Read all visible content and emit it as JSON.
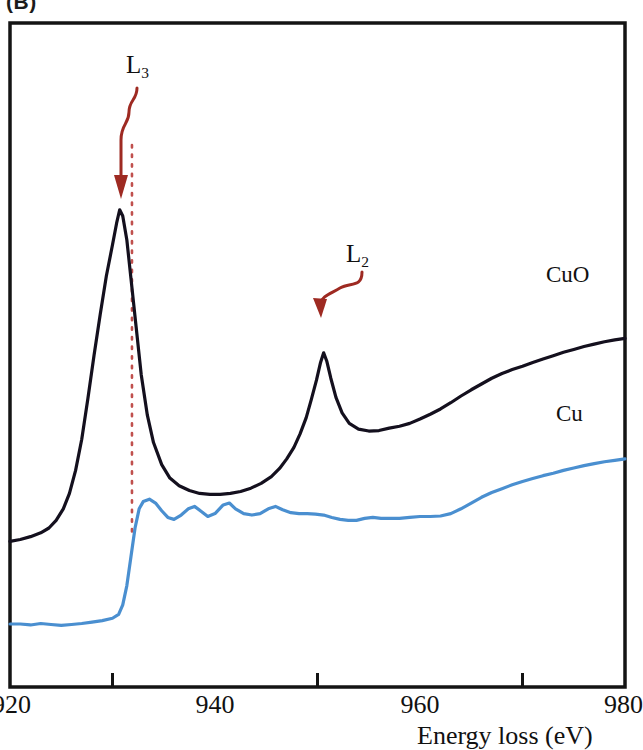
{
  "panel": {
    "letter": "(B)"
  },
  "axis": {
    "x_title": "Energy loss (eV)",
    "ticks": [
      {
        "value": 920,
        "label": "920",
        "major": true
      },
      {
        "value": 930,
        "label": "",
        "major": false
      },
      {
        "value": 940,
        "label": "940",
        "major": true
      },
      {
        "value": 950,
        "label": "",
        "major": false
      },
      {
        "value": 960,
        "label": "960",
        "major": true
      },
      {
        "value": 970,
        "label": "",
        "major": false
      },
      {
        "value": 980,
        "label": "980",
        "major": true
      }
    ]
  },
  "annotations": {
    "l3": {
      "label": "L",
      "sub": "3",
      "arrow_color": "#9e2a22"
    },
    "l2": {
      "label": "L",
      "sub": "2",
      "arrow_color": "#9e2a22"
    },
    "guide_line": {
      "energy": 931.9,
      "color": "#c0504d",
      "style": "dotted"
    }
  },
  "colors": {
    "cuo": "#14101e",
    "cu": "#4a8fd0",
    "frame": "#141414",
    "arrow": "#9e2a22",
    "guide": "#c0504d"
  },
  "chart_data": {
    "type": "line",
    "title": "",
    "xlabel": "Energy loss (eV)",
    "ylabel": "",
    "xlim": [
      920,
      980
    ],
    "ylim": [
      0,
      1
    ],
    "grid": false,
    "legend": "inline-curve-labels",
    "tick_labels_x": [
      "920",
      "940",
      "960",
      "980"
    ],
    "minor_ticks_x": [
      930,
      950,
      970
    ],
    "annotations": [
      {
        "text": "L3",
        "type": "peak-arrow",
        "x": 930.7,
        "note": "L3 white line of CuO"
      },
      {
        "text": "L2",
        "type": "peak-arrow",
        "x": 950.6,
        "note": "L2 white line of CuO"
      },
      {
        "text": "dotted vertical guide",
        "x": 931.9
      }
    ],
    "series": [
      {
        "name": "CuO",
        "color": "#14101e",
        "label_x": 972,
        "points": [
          [
            920.0,
            0.272
          ],
          [
            921.0,
            0.276
          ],
          [
            922.0,
            0.282
          ],
          [
            923.0,
            0.29
          ],
          [
            923.8,
            0.3
          ],
          [
            924.5,
            0.316
          ],
          [
            925.2,
            0.34
          ],
          [
            925.8,
            0.372
          ],
          [
            926.4,
            0.42
          ],
          [
            927.0,
            0.485
          ],
          [
            927.6,
            0.57
          ],
          [
            928.2,
            0.66
          ],
          [
            928.8,
            0.745
          ],
          [
            929.4,
            0.825
          ],
          [
            930.0,
            0.89
          ],
          [
            930.4,
            0.935
          ],
          [
            930.7,
            0.963
          ],
          [
            931.0,
            0.95
          ],
          [
            931.4,
            0.9
          ],
          [
            931.8,
            0.82
          ],
          [
            932.3,
            0.72
          ],
          [
            932.8,
            0.62
          ],
          [
            933.4,
            0.535
          ],
          [
            934.0,
            0.478
          ],
          [
            934.8,
            0.432
          ],
          [
            935.6,
            0.404
          ],
          [
            936.5,
            0.388
          ],
          [
            937.5,
            0.378
          ],
          [
            938.5,
            0.372
          ],
          [
            939.5,
            0.37
          ],
          [
            940.5,
            0.37
          ],
          [
            941.5,
            0.372
          ],
          [
            942.5,
            0.376
          ],
          [
            943.5,
            0.383
          ],
          [
            944.5,
            0.393
          ],
          [
            945.5,
            0.407
          ],
          [
            946.3,
            0.424
          ],
          [
            947.0,
            0.444
          ],
          [
            947.7,
            0.468
          ],
          [
            948.3,
            0.496
          ],
          [
            948.9,
            0.53
          ],
          [
            949.4,
            0.568
          ],
          [
            949.9,
            0.608
          ],
          [
            950.3,
            0.645
          ],
          [
            950.6,
            0.665
          ],
          [
            950.9,
            0.648
          ],
          [
            951.3,
            0.612
          ],
          [
            951.8,
            0.572
          ],
          [
            952.4,
            0.54
          ],
          [
            953.1,
            0.518
          ],
          [
            954.0,
            0.506
          ],
          [
            955.0,
            0.502
          ],
          [
            956.0,
            0.503
          ],
          [
            957.0,
            0.508
          ],
          [
            958.0,
            0.512
          ],
          [
            959.0,
            0.518
          ],
          [
            960.0,
            0.527
          ],
          [
            961.0,
            0.537
          ],
          [
            962.0,
            0.548
          ],
          [
            963.0,
            0.561
          ],
          [
            964.0,
            0.575
          ],
          [
            965.0,
            0.588
          ],
          [
            966.0,
            0.6
          ],
          [
            967.0,
            0.612
          ],
          [
            968.0,
            0.622
          ],
          [
            969.0,
            0.63
          ],
          [
            970.0,
            0.637
          ],
          [
            971.0,
            0.645
          ],
          [
            972.0,
            0.652
          ],
          [
            973.0,
            0.659
          ],
          [
            974.0,
            0.666
          ],
          [
            975.0,
            0.672
          ],
          [
            976.0,
            0.678
          ],
          [
            977.0,
            0.683
          ],
          [
            978.0,
            0.688
          ],
          [
            979.0,
            0.692
          ],
          [
            980.0,
            0.695
          ]
        ]
      },
      {
        "name": "Cu",
        "color": "#4a8fd0",
        "label_x": 973,
        "points": [
          [
            920.0,
            0.1
          ],
          [
            921.0,
            0.1
          ],
          [
            922.0,
            0.098
          ],
          [
            923.0,
            0.101
          ],
          [
            924.0,
            0.099
          ],
          [
            925.0,
            0.097
          ],
          [
            926.0,
            0.099
          ],
          [
            927.0,
            0.101
          ],
          [
            928.0,
            0.104
          ],
          [
            929.0,
            0.107
          ],
          [
            930.0,
            0.112
          ],
          [
            930.6,
            0.12
          ],
          [
            931.0,
            0.14
          ],
          [
            931.4,
            0.18
          ],
          [
            931.8,
            0.24
          ],
          [
            932.2,
            0.3
          ],
          [
            932.6,
            0.34
          ],
          [
            933.0,
            0.355
          ],
          [
            933.6,
            0.36
          ],
          [
            934.2,
            0.352
          ],
          [
            934.8,
            0.336
          ],
          [
            935.4,
            0.322
          ],
          [
            936.0,
            0.318
          ],
          [
            936.7,
            0.327
          ],
          [
            937.4,
            0.34
          ],
          [
            938.0,
            0.345
          ],
          [
            938.7,
            0.334
          ],
          [
            939.3,
            0.324
          ],
          [
            940.0,
            0.33
          ],
          [
            940.8,
            0.348
          ],
          [
            941.4,
            0.352
          ],
          [
            942.0,
            0.34
          ],
          [
            942.8,
            0.33
          ],
          [
            943.6,
            0.327
          ],
          [
            944.4,
            0.33
          ],
          [
            945.2,
            0.34
          ],
          [
            945.9,
            0.345
          ],
          [
            946.6,
            0.338
          ],
          [
            947.4,
            0.332
          ],
          [
            948.2,
            0.33
          ],
          [
            949.0,
            0.33
          ],
          [
            949.8,
            0.329
          ],
          [
            950.6,
            0.327
          ],
          [
            951.4,
            0.322
          ],
          [
            952.2,
            0.318
          ],
          [
            953.0,
            0.316
          ],
          [
            953.8,
            0.316
          ],
          [
            954.6,
            0.32
          ],
          [
            955.4,
            0.322
          ],
          [
            956.2,
            0.32
          ],
          [
            957.0,
            0.32
          ],
          [
            958.0,
            0.32
          ],
          [
            959.0,
            0.322
          ],
          [
            960.0,
            0.324
          ],
          [
            961.0,
            0.324
          ],
          [
            962.0,
            0.325
          ],
          [
            963.0,
            0.33
          ],
          [
            964.0,
            0.34
          ],
          [
            965.0,
            0.352
          ],
          [
            966.0,
            0.364
          ],
          [
            967.0,
            0.374
          ],
          [
            968.0,
            0.382
          ],
          [
            969.0,
            0.39
          ],
          [
            970.0,
            0.397
          ],
          [
            971.0,
            0.403
          ],
          [
            972.0,
            0.409
          ],
          [
            973.0,
            0.414
          ],
          [
            974.0,
            0.42
          ],
          [
            975.0,
            0.425
          ],
          [
            976.0,
            0.43
          ],
          [
            977.0,
            0.434
          ],
          [
            978.0,
            0.438
          ],
          [
            979.0,
            0.441
          ],
          [
            980.0,
            0.444
          ]
        ]
      }
    ]
  }
}
